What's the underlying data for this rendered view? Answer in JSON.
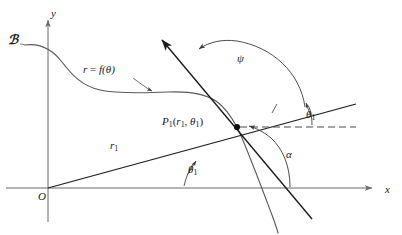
{
  "figure": {
    "width": 402,
    "height": 235,
    "background": "#ffffff",
    "ink_color": "#2b2b2b",
    "axis_color": "#6b6b6b",
    "curve_color": "#5a5a5a",
    "line_color": "#1c1c1c"
  },
  "axes": {
    "x_label": "x",
    "y_label": "y",
    "origin_label": "O",
    "origin": {
      "x": 48,
      "y": 188
    },
    "x_axis": {
      "x1": 6,
      "y1": 188,
      "x2": 374,
      "y2": 188
    },
    "y_axis": {
      "x1": 48,
      "y1": 222,
      "x2": 48,
      "y2": 18
    }
  },
  "curve": {
    "name_label": "ℬ",
    "equation_label": "r = f(θ)",
    "equation_label_parts": {
      "r": "r",
      "eq": "=",
      "f": "f",
      "theta": "(θ)"
    }
  },
  "point": {
    "label_P": "P",
    "label_sub": "1",
    "label_args_open": "(",
    "label_r": "r",
    "label_r_sub": "1",
    "label_comma": ",",
    "label_theta": "θ",
    "label_theta_sub": "1",
    "label_args_close": ")",
    "full_label": "P1(r1, θ1)",
    "x": 237,
    "y": 127
  },
  "segments": {
    "radius_label": "r",
    "radius_label_sub": "1",
    "radius_full": "r1"
  },
  "angles": [
    {
      "name": "psi",
      "symbol": "ψ",
      "description": "angle from radius vector extension to tangent line"
    },
    {
      "name": "alpha",
      "symbol": "α",
      "description": "inclination angle of tangent line measured from positive x-axis"
    },
    {
      "name": "theta1-at-origin",
      "symbol": "θ",
      "symbol_sub": "1",
      "description": "polar angle at origin between x-axis and radius vector"
    },
    {
      "name": "theta1-at-point",
      "symbol": "θ",
      "symbol_sub": "1",
      "description": "angle at P1 between dashed horizontal and radius extension"
    }
  ]
}
